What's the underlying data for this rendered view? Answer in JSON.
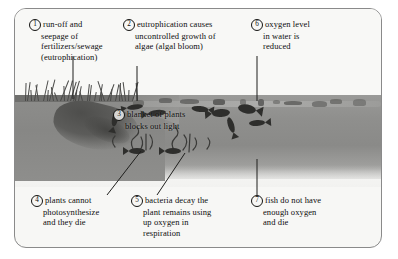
{
  "diagram": {
    "border_color": "#8a8a8a",
    "background_color": "#f7f7f5",
    "water_color": "#8f8f8d",
    "soil_color": "#878785"
  },
  "labels": [
    {
      "number": "1",
      "name": "label-run-off-and-seepage",
      "lines": [
        "run-off and",
        "seepage of",
        "fertilizers/sewage",
        "(eutrophication)"
      ]
    },
    {
      "number": "2",
      "name": "label-eutrophication-causes-algae",
      "lines": [
        "eutrophication causes",
        "uncontrolled growth of",
        "algae (algal bloom)"
      ]
    },
    {
      "number": "6",
      "name": "label-oxygen-level-reduced",
      "lines": [
        "oxygen level",
        "in water is",
        "reduced"
      ]
    },
    {
      "number": "3",
      "name": "label-blanket-of-plants",
      "lines": [
        "blanket of plants",
        "blocks out light"
      ]
    },
    {
      "number": "4",
      "name": "label-plants-cannot-photosynthesize",
      "lines": [
        "plants cannot",
        "photosynthesize",
        "and they die"
      ]
    },
    {
      "number": "5",
      "name": "label-bacteria-decay",
      "lines": [
        "bacteria decay the",
        "plant remains using",
        "up oxygen in",
        "respiration"
      ]
    },
    {
      "number": "7",
      "name": "label-fish-do-not-have-oxygen",
      "lines": [
        "fish do not have",
        "enough oxygen",
        "and die"
      ]
    }
  ],
  "scene": {
    "grass_label": "grass-on-bank",
    "runoff_label": "run-off-flow",
    "algae_label": "algal-blanket",
    "plants_label": "underwater-plants",
    "fish_label": "fish-in-water",
    "water_label": "water-body",
    "soil_label": "soil-bank"
  }
}
